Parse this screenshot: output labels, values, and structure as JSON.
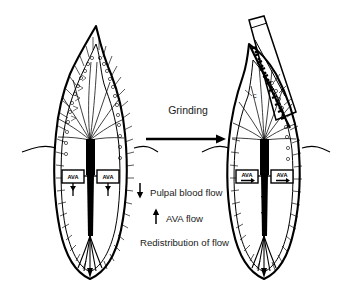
{
  "figure": {
    "background_color": "#ffffff",
    "ink_color": "#000000",
    "caption_color": "#1a1a1a"
  },
  "process": {
    "label": "Grinding",
    "arrow_icon": "right-arrow-icon",
    "direction": "left-to-right"
  },
  "legend": {
    "items": [
      {
        "arrow": "down-arrow-icon",
        "direction": "down",
        "label": "Pulpal blood flow"
      },
      {
        "arrow": "up-arrow-icon",
        "direction": "up",
        "label": "AVA flow"
      }
    ],
    "summary": "Redistribution of flow"
  },
  "left_tooth": {
    "name": "intact-tooth",
    "state": "before grinding",
    "ava_labels": [
      "AVA",
      "AVA"
    ],
    "features": [
      "enamel-outline",
      "dentinal-tubules",
      "pulp-horn-vasculature",
      "pulp-chamber",
      "root-canal",
      "apical-vessels",
      "gingival-line"
    ]
  },
  "right_tooth": {
    "name": "ground-tooth",
    "state": "after grinding",
    "ava_labels": [
      "AVA",
      "AVA"
    ],
    "nerve_label": "C",
    "features": [
      "cut-surface",
      "dental-bur",
      "exposed-dentinal-tubules",
      "dense-nerve-plexus",
      "pulp-horn-vasculature",
      "pulp-chamber",
      "root-canal",
      "apical-vessels",
      "gingival-line",
      "flow-arrows"
    ]
  }
}
